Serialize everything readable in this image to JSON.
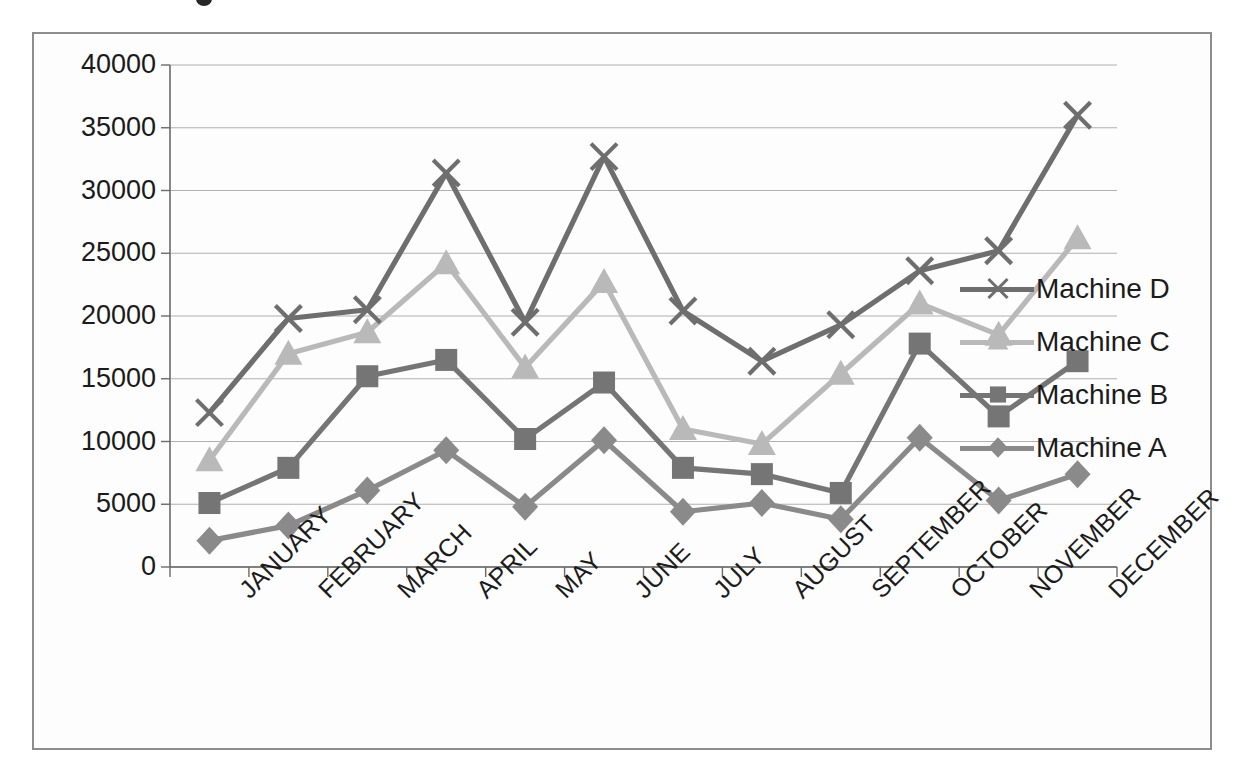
{
  "chart_data": {
    "type": "line",
    "title": "",
    "xlabel": "",
    "ylabel": "",
    "categories": [
      "JANUARY",
      "FEBRUARY",
      "MARCH",
      "APRIL",
      "MAY",
      "JUNE",
      "JULY",
      "AUGUST",
      "SEPTEMBER",
      "OCTOBER",
      "NOVEMBER",
      "DECEMBER"
    ],
    "ylim": [
      0,
      40000
    ],
    "yticks": [
      0,
      5000,
      10000,
      15000,
      20000,
      25000,
      30000,
      35000,
      40000
    ],
    "ytick_labels": [
      "0",
      "5000",
      "10000",
      "15000",
      "20000",
      "25000",
      "30000",
      "35000",
      "40000"
    ],
    "grid": true,
    "legend_position": "right",
    "series": [
      {
        "name": "Machine D",
        "marker": "x",
        "color": "#6e6e6e",
        "values": [
          12300,
          19800,
          20500,
          31400,
          19500,
          32700,
          20400,
          16400,
          19300,
          23600,
          25200,
          36000
        ]
      },
      {
        "name": "Machine C",
        "marker": "triangle",
        "color": "#b9b9b9",
        "values": [
          8500,
          17000,
          18700,
          24200,
          15900,
          22700,
          11000,
          9800,
          15400,
          21000,
          18500,
          26200
        ]
      },
      {
        "name": "Machine B",
        "marker": "square",
        "color": "#757575",
        "values": [
          5100,
          7900,
          15200,
          16500,
          10200,
          14700,
          7900,
          7400,
          5900,
          17800,
          12000,
          16400
        ]
      },
      {
        "name": "Machine A",
        "marker": "diamond",
        "color": "#8a8a8a",
        "values": [
          2100,
          3300,
          6100,
          9300,
          4800,
          10100,
          4400,
          5100,
          3800,
          10300,
          5300,
          7400
        ]
      }
    ]
  },
  "legend": {
    "items": [
      {
        "label": "Machine D"
      },
      {
        "label": "Machine C"
      },
      {
        "label": "Machine B"
      },
      {
        "label": "Machine A"
      }
    ]
  },
  "colors": {
    "frame_border": "#8d8d8d",
    "axis": "#6a6a6a",
    "grid": "#b0b0b0",
    "text": "#1b1b1b",
    "background": "#ffffff"
  }
}
